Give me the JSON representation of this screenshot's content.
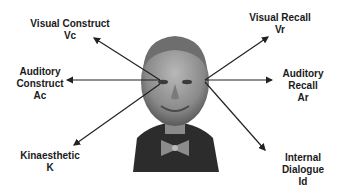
{
  "diagram": {
    "labels": {
      "visual_construct": {
        "line1": "Visual Construct",
        "line2": "Vc"
      },
      "visual_recall": {
        "line1": "Visual Recall",
        "line2": "Vr"
      },
      "auditory_construct": {
        "line1": "Auditory",
        "line2": "Construct",
        "line3": "Ac"
      },
      "auditory_recall": {
        "line1": "Auditory",
        "line2": "Recall",
        "line3": "Ar"
      },
      "kinaesthetic": {
        "line1": "Kinaesthetic",
        "line2": "K"
      },
      "internal_dialogue": {
        "line1": "Internal",
        "line2": "Dialogue",
        "line3": "Id"
      }
    },
    "colors": {
      "text": "#1a1a1a",
      "arrow": "#222222",
      "photo_bg": "#555555",
      "suit": "#2a2a2a",
      "skin": "#9a9a9a"
    }
  }
}
